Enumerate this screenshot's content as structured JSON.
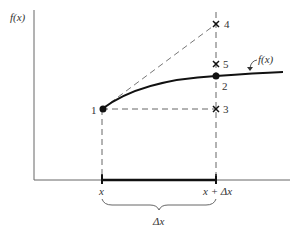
{
  "diagram": {
    "y_axis_label": "f(x)",
    "curve_label": "f(x)",
    "x_tick_left": "x",
    "x_tick_right": "x + Δx",
    "interval_label": "Δx",
    "points": [
      {
        "id": "1",
        "label": "1",
        "marker": "dot"
      },
      {
        "id": "2",
        "label": "2",
        "marker": "dot"
      },
      {
        "id": "3",
        "label": "3",
        "marker": "cross"
      },
      {
        "id": "4",
        "label": "4",
        "marker": "cross"
      },
      {
        "id": "5",
        "label": "5",
        "marker": "cross"
      }
    ],
    "colors": {
      "curve": "#111111",
      "axis": "#555555",
      "dashed": "#666666"
    }
  }
}
